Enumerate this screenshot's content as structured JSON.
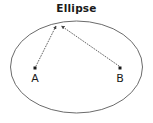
{
  "figure": {
    "title": "Ellipse",
    "type": "geometry-diagram",
    "background_color": "#ffffff",
    "stroke_color": "#555555",
    "text_color": "#1a1a1a"
  },
  "shape": {
    "name": "ellipse",
    "center": {
      "x": 76.5,
      "y": 67
    },
    "radius_x": 66,
    "radius_y": 46,
    "stroke_color": "#6b6b6b",
    "stroke_width": 1,
    "fill": "none"
  },
  "points": [
    {
      "id": "focus-a",
      "label": "A",
      "x": 35,
      "y": 68,
      "label_x": 35,
      "label_y": 79,
      "marker": "square-dot",
      "color": "#1a1a1a"
    },
    {
      "id": "focus-b",
      "label": "B",
      "x": 120,
      "y": 68,
      "label_x": 120,
      "label_y": 79,
      "marker": "square-dot",
      "color": "#1a1a1a"
    },
    {
      "id": "point-p",
      "label": "",
      "x": 58,
      "y": 24,
      "marker": "none",
      "color": "#1a1a1a"
    }
  ],
  "connectors": [
    {
      "id": "segment-a-to-p",
      "from": "focus-a",
      "to": "point-p",
      "x1": 36,
      "y1": 66,
      "x2": 56,
      "y2": 26,
      "style": "dotted",
      "arrowhead": "end",
      "color": "#555555"
    },
    {
      "id": "segment-b-to-p",
      "from": "focus-b",
      "to": "point-p",
      "x1": 119,
      "y1": 66,
      "x2": 61,
      "y2": 26,
      "style": "dotted",
      "arrowhead": "end",
      "color": "#555555"
    }
  ],
  "icons": {
    "arrowhead": "arrow-head-icon",
    "dot": "point-marker-icon"
  }
}
